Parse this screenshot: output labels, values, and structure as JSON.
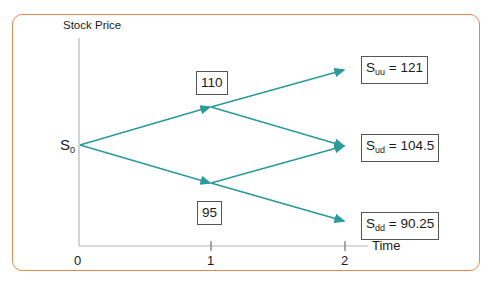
{
  "diagram": {
    "y_axis_label": "Stock Price",
    "x_axis_label": "Time",
    "x_ticks": [
      "0",
      "1",
      "2"
    ],
    "colors": {
      "frame": "#e8864f",
      "arrows": "#2a9a9a",
      "axis": "#b8b8b8",
      "box_border": "#555555"
    },
    "root": {
      "symbol": "S",
      "subscript": "0"
    },
    "nodes": {
      "up": {
        "value": "110"
      },
      "down": {
        "value": "95"
      },
      "uu": {
        "symbol": "S",
        "subscript": "uu",
        "equals": " = ",
        "value": "121"
      },
      "ud": {
        "symbol": "S",
        "subscript": "ud",
        "equals": " = ",
        "value": "104.5"
      },
      "dd": {
        "symbol": "S",
        "subscript": "dd",
        "equals": " = ",
        "value": "90.25"
      }
    }
  }
}
